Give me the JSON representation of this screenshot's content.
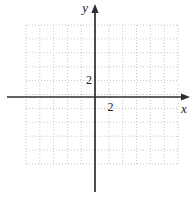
{
  "chart_data": {
    "type": "coordinate-grid",
    "title": "",
    "xlabel": "x",
    "ylabel": "y",
    "x_tick_labels": [
      "2"
    ],
    "y_tick_labels": [
      "2"
    ],
    "units_per_grid_square": 2,
    "xlim": [
      -10,
      12
    ],
    "ylim": [
      -10,
      10
    ],
    "grid_columns": 11,
    "grid_rows": 10,
    "grid_line_style": "dotted",
    "grid_on": true,
    "grid_color": "#c6c6c6",
    "axis_color": "#2e2e2e",
    "label_color": "#1a1a1a",
    "background_color": "#ffffff"
  }
}
